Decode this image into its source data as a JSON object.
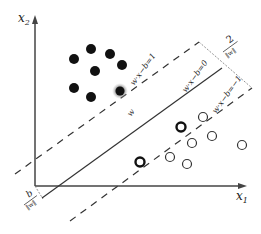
{
  "axes": {
    "x_label": "x",
    "x_sub": "1",
    "y_label": "x",
    "y_sub": "2"
  },
  "lines": {
    "upper_margin": "w·x−b=1",
    "hyperplane": "w·x−b=0",
    "lower_margin": "w·x−b=−1",
    "normal_vector": "w"
  },
  "annotations": {
    "margin_width_num": "2",
    "margin_width_den": "‖w‖",
    "offset_num": "b",
    "offset_den": "‖w‖"
  },
  "points": {
    "class_filled": [
      [
        74,
        59
      ],
      [
        91,
        49
      ],
      [
        110,
        54
      ],
      [
        95,
        71
      ],
      [
        122,
        65
      ],
      [
        74,
        88
      ],
      [
        91,
        97
      ]
    ],
    "class_filled_support": [
      [
        120,
        91
      ]
    ],
    "class_open": [
      [
        203,
        117
      ],
      [
        212,
        136
      ],
      [
        192,
        143
      ],
      [
        242,
        145
      ],
      [
        170,
        157
      ],
      [
        187,
        164
      ]
    ],
    "class_open_support": [
      [
        181,
        127
      ],
      [
        140,
        162
      ]
    ]
  },
  "colors": {
    "ink": "#222222",
    "support_glow": "#999999"
  }
}
